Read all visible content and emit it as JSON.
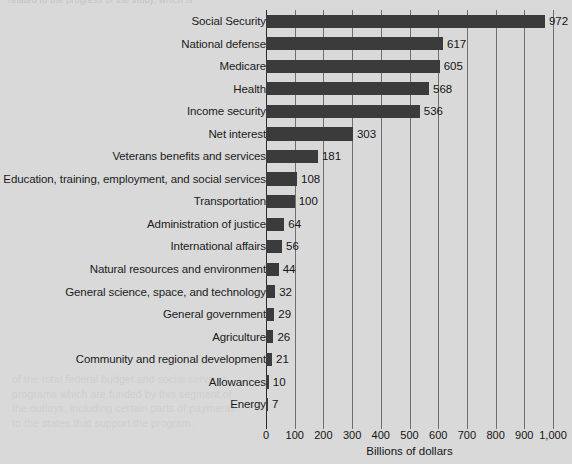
{
  "page": {
    "bleed_top_text": "related to the progress of the study, which is",
    "bleed_body_text": "of the total federal budget and social services\nprograms which are funded by this segment of\nthe outlays, including certain parts of payments\nto the states that support the program."
  },
  "chart_data": {
    "type": "bar",
    "orientation": "horizontal",
    "title": "",
    "xlabel": "Billions of dollars",
    "ylabel": "",
    "xlim": [
      0,
      1000
    ],
    "grid": true,
    "legend": null,
    "tick_labels": [
      "0",
      "100",
      "200",
      "300",
      "400",
      "500",
      "600",
      "700",
      "800",
      "900",
      "1,000"
    ],
    "tick_values": [
      0,
      100,
      200,
      300,
      400,
      500,
      600,
      700,
      800,
      900,
      1000
    ],
    "categories": [
      "Social Security",
      "National defense",
      "Medicare",
      "Health",
      "Income security",
      "Net interest",
      "Veterans benefits and services",
      "Education, training, employment, and social services",
      "Transportation",
      "Administration of justice",
      "International affairs",
      "Natural resources and environment",
      "General science, space, and technology",
      "General government",
      "Agriculture",
      "Community and regional development",
      "Allowances",
      "Energy"
    ],
    "values": [
      972,
      617,
      605,
      568,
      536,
      303,
      181,
      108,
      100,
      64,
      56,
      44,
      32,
      29,
      26,
      21,
      10,
      7
    ],
    "value_labels": [
      "972",
      "617",
      "605",
      "568",
      "536",
      "303",
      "181",
      "108",
      "100",
      "64",
      "56",
      "44",
      "32",
      "29",
      "26",
      "21",
      "10",
      "7"
    ],
    "bar_color": "#3b3b3b",
    "background_color": "#d9d9d9",
    "gridline_color": "#6f6f6f",
    "axis_color": "#2a2a2a"
  }
}
